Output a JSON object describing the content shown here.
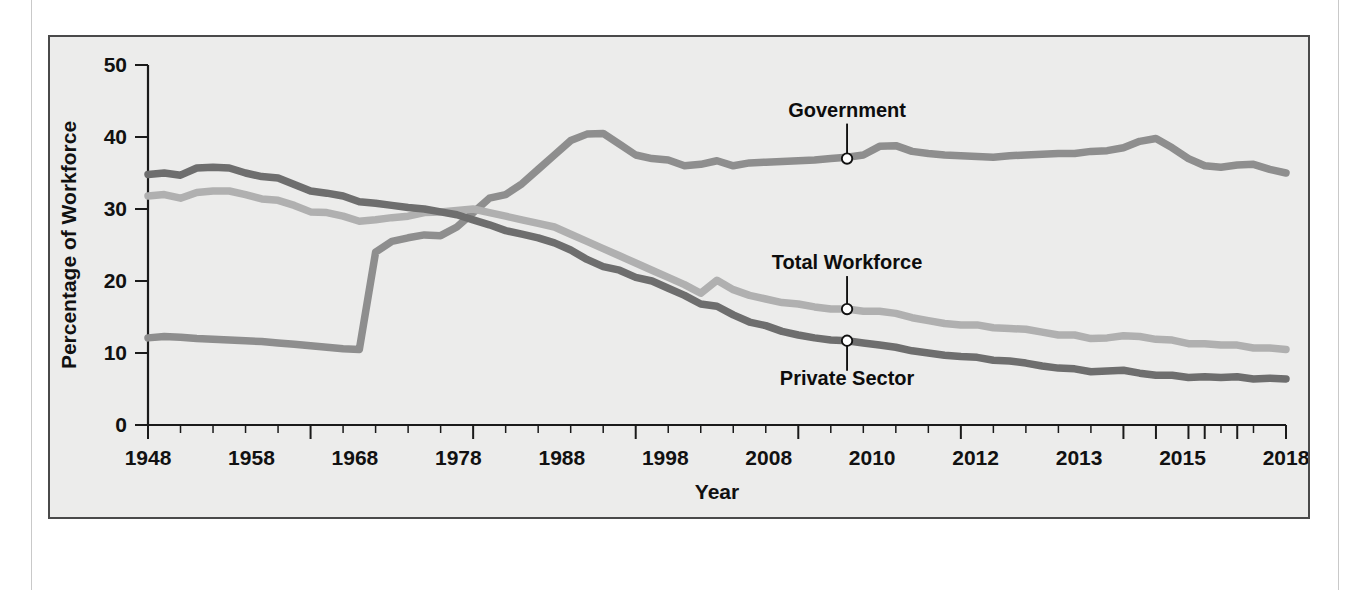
{
  "figure": {
    "background_color": "#ececeb",
    "border_color": "#4a4a4a"
  },
  "chart_data": {
    "type": "line",
    "title": "",
    "xlabel": "Year",
    "ylabel": "Percentage of Workforce",
    "xlim": [
      1948,
      2018
    ],
    "ylim": [
      0,
      50
    ],
    "grid": false,
    "legend_position": "inline-annotations",
    "ytick_labels": [
      "0",
      "10",
      "20",
      "30",
      "40",
      "50"
    ],
    "ytick_values": [
      0,
      10,
      20,
      30,
      40,
      50
    ],
    "xtick_labels": [
      "1948",
      "1958",
      "1968",
      "1978",
      "1988",
      "1998",
      "2008",
      "2010",
      "2012",
      "2013",
      "2015",
      "2018"
    ],
    "xtick_values": [
      1948,
      1958,
      1968,
      1978,
      1988,
      1998,
      2008,
      2010,
      2012,
      2013,
      2015,
      2018
    ],
    "xtick_minor_step": 2,
    "series": [
      {
        "name": "Government",
        "color": "#8e8e8e",
        "annotation": "Government",
        "annotation_point": {
          "x": 1991,
          "y": 37.0
        },
        "x": [
          1948,
          1949,
          1950,
          1951,
          1952,
          1953,
          1954,
          1955,
          1956,
          1957,
          1958,
          1959,
          1960,
          1961,
          1962,
          1963,
          1964,
          1965,
          1966,
          1967,
          1968,
          1969,
          1970,
          1971,
          1972,
          1973,
          1974,
          1975,
          1976,
          1977,
          1978,
          1979,
          1980,
          1981,
          1982,
          1983,
          1984,
          1985,
          1986,
          1987,
          1988,
          1989,
          1990,
          1991,
          1992,
          1993,
          1994,
          1995,
          1996,
          1997,
          1998,
          1999,
          2000,
          2001,
          2002,
          2003,
          2004,
          2005,
          2006,
          2007,
          2008,
          2009,
          2010,
          2011,
          2012,
          2013,
          2014,
          2015,
          2016,
          2017,
          2018
        ],
        "y": [
          12.1,
          12.3,
          12.2,
          12.0,
          11.9,
          11.8,
          11.7,
          11.6,
          11.4,
          11.2,
          11.0,
          10.8,
          10.6,
          10.5,
          24.0,
          25.5,
          26.0,
          26.4,
          26.3,
          27.5,
          29.5,
          31.5,
          32.0,
          33.5,
          35.5,
          37.5,
          39.5,
          40.4,
          40.5,
          39.0,
          37.5,
          37.0,
          36.8,
          36.0,
          36.2,
          36.7,
          36.0,
          36.4,
          36.5,
          36.6,
          36.7,
          36.8,
          37.0,
          37.2,
          37.5,
          38.7,
          38.8,
          38.0,
          37.7,
          37.5,
          37.4,
          37.3,
          37.2,
          37.4,
          37.5,
          37.6,
          37.7,
          37.7,
          38.0,
          38.1,
          38.5,
          39.4,
          39.8,
          38.5,
          37.0,
          36.0,
          35.8,
          36.1,
          36.2,
          35.5,
          35.0
        ]
      },
      {
        "name": "Total Workforce",
        "color": "#b0b0b0",
        "annotation": "Total Workforce",
        "annotation_point": {
          "x": 1991,
          "y": 16.1
        },
        "x": [
          1948,
          1949,
          1950,
          1951,
          1952,
          1953,
          1954,
          1955,
          1956,
          1957,
          1958,
          1959,
          1960,
          1961,
          1962,
          1963,
          1964,
          1965,
          1966,
          1967,
          1968,
          1969,
          1970,
          1971,
          1972,
          1973,
          1974,
          1975,
          1976,
          1977,
          1978,
          1979,
          1980,
          1981,
          1982,
          1983,
          1984,
          1985,
          1986,
          1987,
          1988,
          1989,
          1990,
          1991,
          1992,
          1993,
          1994,
          1995,
          1996,
          1997,
          1998,
          1999,
          2000,
          2001,
          2002,
          2003,
          2004,
          2005,
          2006,
          2007,
          2008,
          2009,
          2010,
          2011,
          2012,
          2013,
          2014,
          2015,
          2016,
          2017,
          2018
        ],
        "y": [
          31.8,
          32.0,
          31.5,
          32.3,
          32.5,
          32.5,
          32.0,
          31.4,
          31.2,
          30.5,
          29.6,
          29.5,
          29.0,
          28.3,
          28.5,
          28.8,
          29.0,
          29.5,
          29.6,
          29.8,
          30.0,
          29.5,
          29.0,
          28.5,
          28.0,
          27.5,
          26.5,
          25.5,
          24.5,
          23.5,
          22.5,
          21.5,
          20.5,
          19.5,
          18.3,
          20.1,
          18.8,
          18.0,
          17.5,
          17.0,
          16.8,
          16.4,
          16.1,
          16.1,
          15.8,
          15.8,
          15.5,
          14.9,
          14.5,
          14.1,
          13.9,
          13.9,
          13.5,
          13.4,
          13.3,
          12.9,
          12.5,
          12.5,
          12.0,
          12.1,
          12.4,
          12.3,
          11.9,
          11.8,
          11.3,
          11.3,
          11.1,
          11.1,
          10.7,
          10.7,
          10.5
        ]
      },
      {
        "name": "Private Sector",
        "color": "#6e6e6e",
        "annotation": "Private Sector",
        "annotation_point": {
          "x": 1991,
          "y": 11.7
        },
        "x": [
          1948,
          1949,
          1950,
          1951,
          1952,
          1953,
          1954,
          1955,
          1956,
          1957,
          1958,
          1959,
          1960,
          1961,
          1962,
          1963,
          1964,
          1965,
          1966,
          1967,
          1968,
          1969,
          1970,
          1971,
          1972,
          1973,
          1974,
          1975,
          1976,
          1977,
          1978,
          1979,
          1980,
          1981,
          1982,
          1983,
          1984,
          1985,
          1986,
          1987,
          1988,
          1989,
          1990,
          1991,
          1992,
          1993,
          1994,
          1995,
          1996,
          1997,
          1998,
          1999,
          2000,
          2001,
          2002,
          2003,
          2004,
          2005,
          2006,
          2007,
          2008,
          2009,
          2010,
          2011,
          2012,
          2013,
          2014,
          2015,
          2016,
          2017,
          2018
        ],
        "y": [
          34.8,
          35.0,
          34.7,
          35.7,
          35.8,
          35.7,
          35.0,
          34.5,
          34.3,
          33.4,
          32.5,
          32.2,
          31.8,
          31.0,
          30.8,
          30.5,
          30.2,
          30.0,
          29.6,
          29.2,
          28.5,
          27.8,
          27.0,
          26.5,
          26.0,
          25.3,
          24.3,
          23.0,
          22.0,
          21.5,
          20.5,
          20.0,
          19.0,
          18.0,
          16.8,
          16.5,
          15.3,
          14.3,
          13.8,
          13.0,
          12.5,
          12.1,
          11.8,
          11.7,
          11.4,
          11.1,
          10.8,
          10.3,
          10.0,
          9.7,
          9.5,
          9.4,
          9.0,
          8.9,
          8.6,
          8.2,
          7.9,
          7.8,
          7.4,
          7.5,
          7.6,
          7.2,
          6.9,
          6.9,
          6.6,
          6.7,
          6.6,
          6.7,
          6.4,
          6.5,
          6.4
        ]
      }
    ]
  }
}
